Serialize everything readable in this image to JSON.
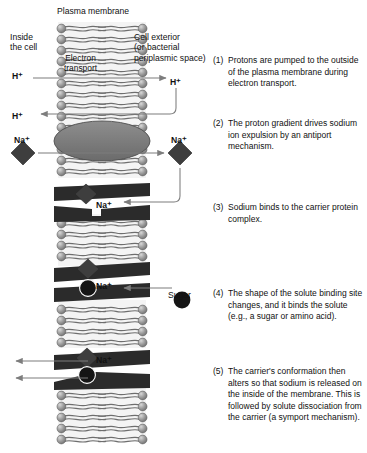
{
  "figure": {
    "title": "Plasma membrane",
    "regions": {
      "inside": "Inside\nthe cell",
      "exterior": "Cell exterior\n(or bacterial\nperiplasmic space)",
      "membrane_interior_label": "Electron\ntransport"
    },
    "ion_labels": {
      "proton_inside_upper": "H⁺",
      "proton_inside_lower": "H⁺",
      "proton_outside": "H⁺",
      "sodium_inside": "Na⁺",
      "sodium_outside": "Na⁺",
      "sodium_step3": "Na⁺",
      "sodium_step4": "Na⁺",
      "sodium_step5": "Na⁺",
      "sugar": "Sugar"
    },
    "steps": [
      {
        "number": "(1)",
        "text": "Protons are pumped to the outside of the plasma membrane during electron transport."
      },
      {
        "number": "(2)",
        "text": "The proton gradient drives sodium ion expulsion by an antiport mechanism."
      },
      {
        "number": "(3)",
        "text": "Sodium binds to the carrier protein complex."
      },
      {
        "number": "(4)",
        "text": "The shape of the solute binding site changes, and it binds the solute (e.g., a sugar or amino acid)."
      },
      {
        "number": "(5)",
        "text": "The carrier's conformation then alters so that sodium is released on the inside of the membrane. This is followed by solute dissociation from the carrier (a symport mechanism)."
      }
    ],
    "colors": {
      "background": "#ffffff",
      "text": "#111111",
      "lipid_head": "#8f8f8f",
      "lipid_head_highlight": "#c9c9c9",
      "lipid_head_stroke": "#5a5a5a",
      "lipid_tail": "#6e6e6e",
      "membrane_core": "#f2f2f2",
      "antiporter_fill": "#7a7a7a",
      "antiporter_stroke": "#4a4a4a",
      "carrier_protein": "#2b2b2b",
      "sodium_diamond": "#3a3a3a",
      "sugar_circle": "#151515",
      "arrow": "#7d7d7d"
    }
  }
}
